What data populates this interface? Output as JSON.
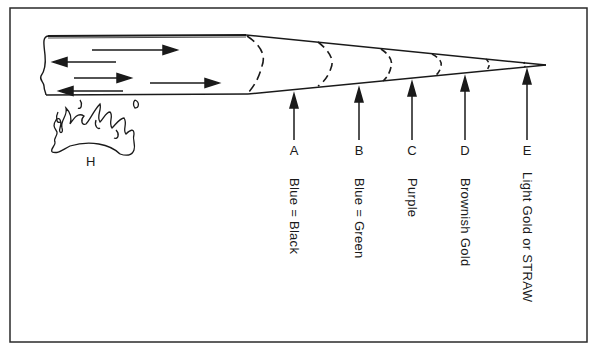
{
  "diagram": {
    "title": "",
    "colors": {
      "ink": "#1a1a1a",
      "background": "#ffffff",
      "frame": "#2a2a2a"
    },
    "heat_source": {
      "label": "H"
    },
    "zones": [
      {
        "letter": "A",
        "color_name": "Blue = Black"
      },
      {
        "letter": "B",
        "color_name": "Blue = Green"
      },
      {
        "letter": "C",
        "color_name": "Purple"
      },
      {
        "letter": "D",
        "color_name": "Brownish  Gold"
      },
      {
        "letter": "E",
        "color_name": "Light  Gold  or  STRAW"
      }
    ]
  }
}
